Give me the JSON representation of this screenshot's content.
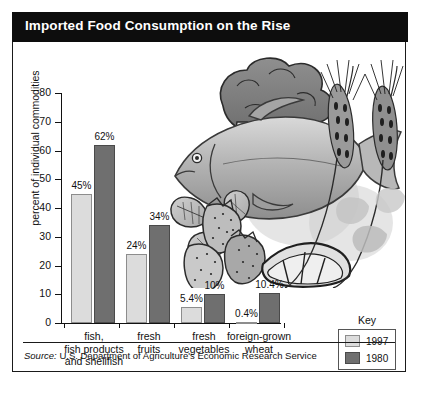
{
  "title": "Imported Food Consumption on the Rise",
  "source_prefix": "Source:",
  "source_text": "U.S. Department of Agriculture's Economic Research Service",
  "legend": {
    "title": "Key",
    "entries": [
      {
        "label": "1997",
        "color": "#dcdcdc"
      },
      {
        "label": "1980",
        "color": "#6f6f6f"
      }
    ]
  },
  "illustration": {
    "caption": "grayscale illustration of fish, broccoli, strawberries, citrus wedge and wheat stalks"
  },
  "chart_data": {
    "type": "bar",
    "title": "Imported Food Consumption on the Rise",
    "xlabel": "",
    "ylabel": "percent of individual commodities",
    "ylim": [
      0,
      80
    ],
    "yticks": [
      0,
      10,
      20,
      30,
      40,
      50,
      60,
      70,
      80
    ],
    "grid": false,
    "legend_position": "bottom-right",
    "categories": [
      "fish,\nfish products\nand shellfish",
      "fresh\nfruits",
      "fresh\nvegetables",
      "foreign-grown\nwheat"
    ],
    "series": [
      {
        "name": "1997",
        "color": "#dcdcdc",
        "values": [
          45,
          24,
          5.4,
          0.4
        ],
        "labels": [
          "45%",
          "24%",
          "5.4%",
          "0.4%"
        ]
      },
      {
        "name": "1980",
        "color": "#6f6f6f",
        "values": [
          62,
          34,
          10,
          10.4
        ],
        "labels": [
          "62%",
          "34%",
          "10%",
          "10.4%"
        ]
      }
    ]
  }
}
